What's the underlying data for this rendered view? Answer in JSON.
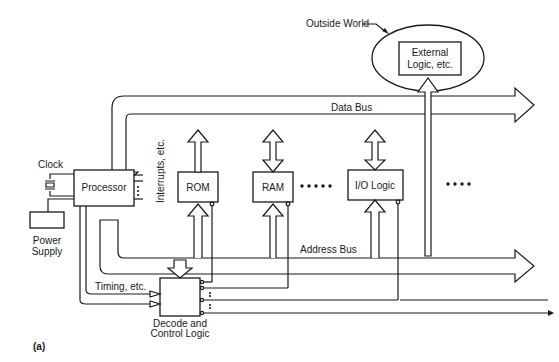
{
  "figure": {
    "label": "(a)",
    "outside_world_label": "Outside World",
    "external_logic": "External",
    "external_logic_2": "Logic, etc.",
    "data_bus": "Data Bus",
    "address_bus": "Address Bus",
    "clock": "Clock",
    "power_supply_1": "Power",
    "power_supply_2": "Supply",
    "processor": "Processor",
    "interrupts": "Interrupts, etc.",
    "rom": "ROM",
    "ram": "RAM",
    "io_logic": "I/O Logic",
    "timing": "Timing, etc.",
    "decode_1": "Decode and",
    "decode_2": "Control Logic"
  },
  "colors": {
    "ink": "#1a1a1a",
    "background": "#ffffff"
  }
}
